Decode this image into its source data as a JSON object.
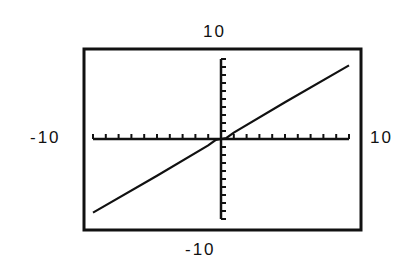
{
  "chart_data": {
    "type": "line",
    "title": "",
    "xlabel": "",
    "ylabel": "",
    "window_labels": {
      "top": "10",
      "bottom": "-10",
      "left": "-10",
      "right": "10"
    },
    "xlim": [
      -10,
      10
    ],
    "ylim": [
      -10,
      10
    ],
    "xtick_step": 1,
    "ytick_step": 1,
    "grid": false,
    "legend": null,
    "series": [
      {
        "name": "graph",
        "description": "nearly straight line through origin with slight wiggle near origin",
        "x": [
          -10,
          -5,
          -1,
          -0.4,
          0,
          0.4,
          1,
          5,
          10
        ],
        "y": [
          -9.2,
          -4.6,
          -0.8,
          -0.1,
          0,
          0.1,
          0.8,
          4.6,
          9.2
        ]
      }
    ]
  },
  "colors": {
    "background": "#ffffff",
    "ink": "#111111"
  }
}
